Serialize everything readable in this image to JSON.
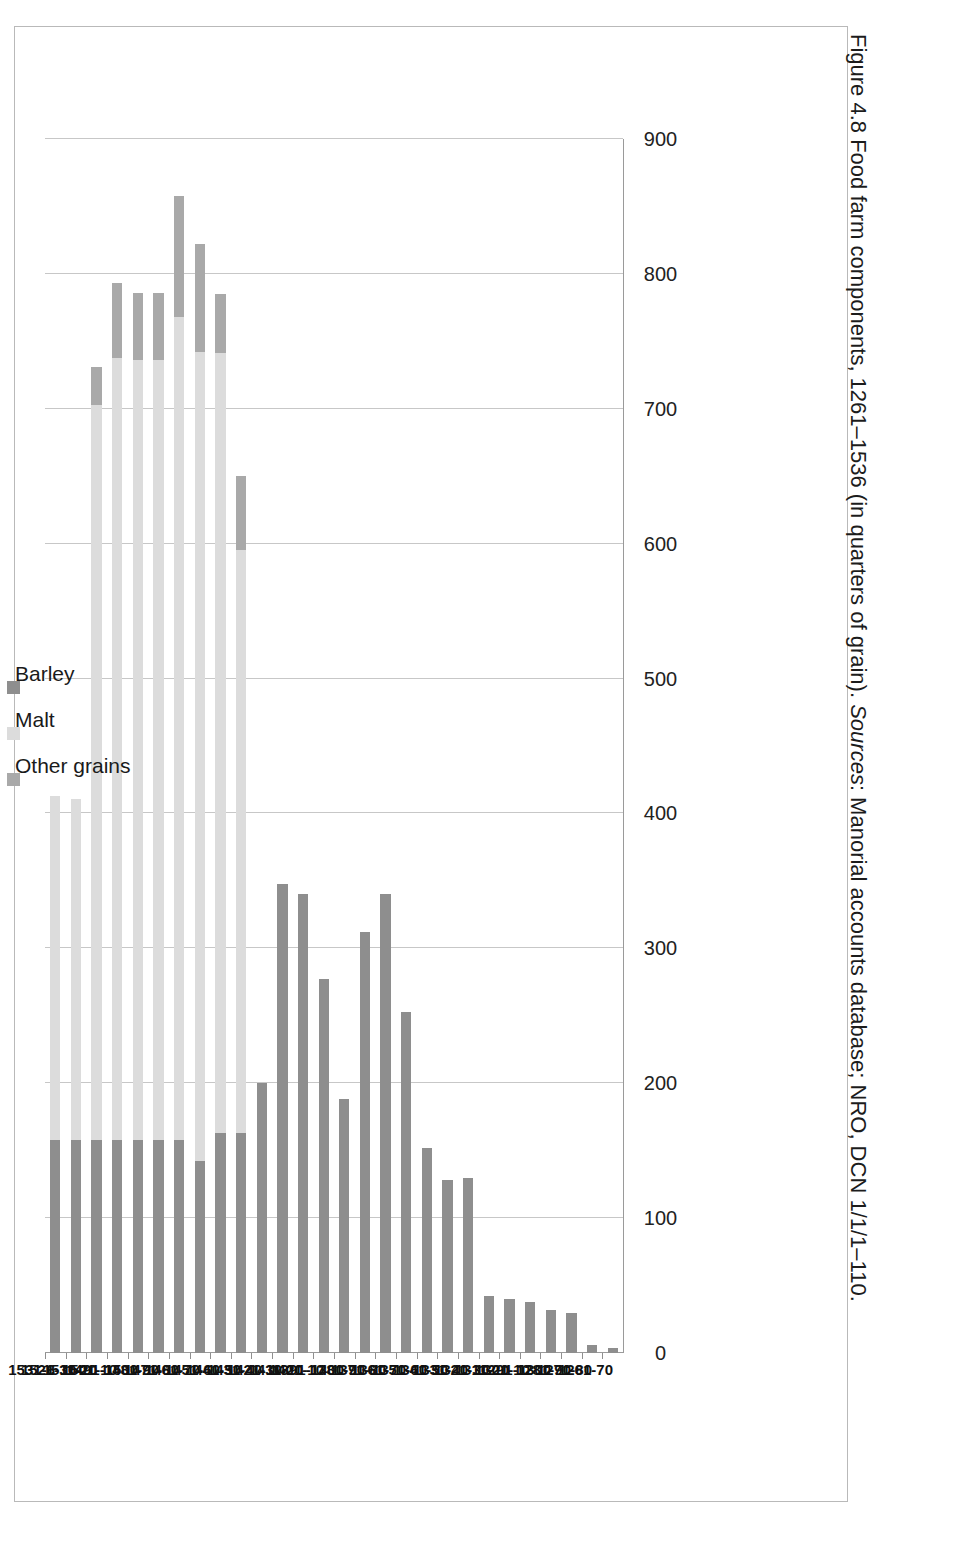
{
  "figure": {
    "caption_main": "Figure 4.8 Food farm components, 1261–1536 (in quarters of grain).",
    "caption_sources_label": "Sources",
    "caption_sources_text": ": Manorial accounts database; NRO, DCN 1/1/1–110."
  },
  "legend": {
    "position": "top-right",
    "items": [
      {
        "label": "Other grains",
        "color": "#a9a9a9"
      },
      {
        "label": "Malt",
        "color": "#dcdcdc"
      },
      {
        "label": "Barley",
        "color": "#8e8e8e"
      }
    ]
  },
  "axis": {
    "value_ticks": [
      "0",
      "100",
      "200",
      "300",
      "400",
      "500",
      "600",
      "700",
      "800",
      "900"
    ],
    "value_min": 0,
    "value_max": 900
  },
  "chart_data": {
    "type": "bar",
    "orientation": "horizontal-rotated",
    "stacked": true,
    "title": "Food farm components, 1261–1536 (in quarters of grain)",
    "xlabel": "",
    "ylabel": "",
    "ylim": [
      0,
      900
    ],
    "grid": true,
    "legend_position": "top-right",
    "categories": [
      "1261-70",
      "1271-80",
      "1281-90",
      "1291-1300",
      "1301-10",
      "1311-20",
      "1321-30",
      "1331-40",
      "1341-50",
      "1351-60",
      "1361-70",
      "1371-80",
      "1381-90",
      "1391-1400",
      "1401-10",
      "1411-20",
      "1421-30",
      "1431-40",
      "1441-50",
      "1451-60",
      "1461-70",
      "1471-80",
      "1481-90",
      "1491-1500",
      "1501-10",
      "1511-20",
      "1521-30",
      "1531-6"
    ],
    "series": [
      {
        "name": "Barley",
        "color": "#8e8e8e",
        "values": [
          4,
          6,
          30,
          32,
          38,
          40,
          42,
          130,
          128,
          152,
          253,
          340,
          312,
          188,
          277,
          340,
          348,
          200,
          163,
          163,
          142,
          158,
          158,
          158,
          158,
          158,
          158,
          158
        ]
      },
      {
        "name": "Malt",
        "color": "#dcdcdc",
        "values": [
          0,
          0,
          0,
          0,
          0,
          0,
          0,
          0,
          0,
          0,
          0,
          0,
          0,
          0,
          0,
          0,
          0,
          0,
          432,
          578,
          600,
          610,
          578,
          578,
          580,
          545,
          253,
          255
        ]
      },
      {
        "name": "Other grains",
        "color": "#a9a9a9",
        "values": [
          0,
          0,
          0,
          0,
          0,
          0,
          0,
          0,
          0,
          0,
          0,
          0,
          0,
          0,
          0,
          0,
          0,
          0,
          55,
          44,
          80,
          90,
          50,
          50,
          55,
          28,
          0,
          0
        ]
      }
    ]
  }
}
